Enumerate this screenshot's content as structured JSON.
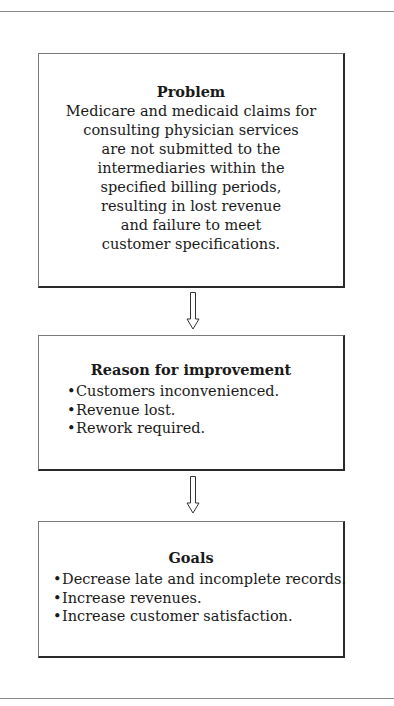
{
  "diagram": {
    "type": "flowchart",
    "direction": "top-to-bottom",
    "boxes": [
      {
        "id": "problem",
        "title": "Problem",
        "lines": [
          "Medicare and medicaid claims for",
          "consulting physician services",
          "are not submitted to the",
          "intermediaries within the",
          "specified billing periods,",
          "resulting in lost revenue",
          "and failure to meet",
          "customer specifications."
        ]
      },
      {
        "id": "reason",
        "title": "Reason for improvement",
        "bullets": [
          "Customers inconvenienced.",
          "Revenue lost.",
          "Rework required."
        ]
      },
      {
        "id": "goals",
        "title": "Goals",
        "bullets": [
          "Decrease late and incomplete records.",
          "Increase revenues.",
          "Increase customer satisfaction."
        ]
      }
    ],
    "arrows": [
      {
        "from": "problem",
        "to": "reason",
        "icon": "down-arrow-icon"
      },
      {
        "from": "reason",
        "to": "goals",
        "icon": "down-arrow-icon"
      }
    ],
    "bullet_glyph": "•"
  }
}
